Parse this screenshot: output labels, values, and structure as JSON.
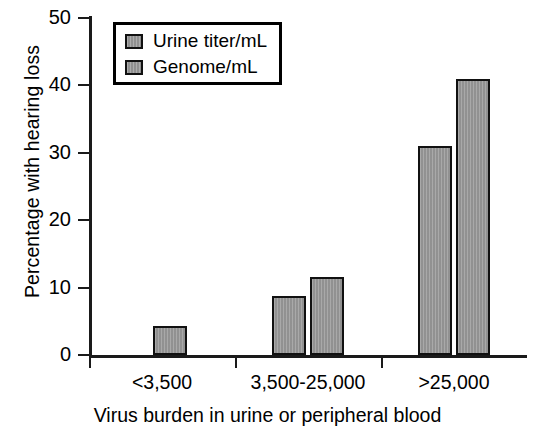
{
  "chart_data": {
    "type": "bar",
    "title": "",
    "xlabel": "Virus burden in urine or peripheral blood",
    "ylabel": "Percentage with hearing loss",
    "categories": [
      "<3,500",
      "3,500-25,000",
      ">25,000"
    ],
    "series": [
      {
        "name": "Urine titer/mL",
        "values": [
          null,
          8.8,
          31.0
        ],
        "color": "#999999"
      },
      {
        "name": "Genome/mL",
        "values": [
          4.3,
          11.6,
          41.0
        ],
        "color": "#999999"
      }
    ],
    "ylim": [
      0,
      50
    ],
    "yticks": [
      0,
      10,
      20,
      30,
      40,
      50
    ],
    "ytick_labels": [
      "0",
      "10",
      "20",
      "30",
      "40",
      "50"
    ],
    "grid": false,
    "legend_position": "top-left",
    "legend_entries": [
      "Urine titer/mL",
      "Genome/mL"
    ],
    "axis_color": "#1a1a1a",
    "bar_edge_color": "#111111"
  },
  "axes": {
    "y_ticks": [
      {
        "label": "50",
        "value": 50
      },
      {
        "label": "40",
        "value": 40
      },
      {
        "label": "30",
        "value": 30
      },
      {
        "label": "20",
        "value": 20
      },
      {
        "label": "10",
        "value": 10
      },
      {
        "label": "0",
        "value": 0
      }
    ],
    "x_categories": [
      {
        "label": "<3,500"
      },
      {
        "label": "3,500-25,000"
      },
      {
        "label": ">25,000"
      }
    ],
    "x_title": "Virus burden in urine or peripheral blood",
    "y_title": "Percentage with hearing loss"
  },
  "legend": {
    "items": [
      {
        "label": "Urine titer/mL"
      },
      {
        "label": "Genome/mL"
      }
    ]
  },
  "bars": [
    {
      "category": "<3,500",
      "series": "Genome/mL",
      "value": 4.3
    },
    {
      "category": "3,500-25,000",
      "series": "Urine titer/mL",
      "value": 8.8
    },
    {
      "category": "3,500-25,000",
      "series": "Genome/mL",
      "value": 11.6
    },
    {
      "category": ">25,000",
      "series": "Urine titer/mL",
      "value": 31.0
    },
    {
      "category": ">25,000",
      "series": "Genome/mL",
      "value": 41.0
    }
  ]
}
